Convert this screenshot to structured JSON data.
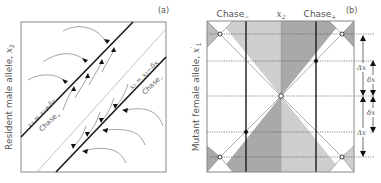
{
  "panel_a": {
    "tag": "(a)",
    "ylabel": "Resident male allele, ",
    "ylabel_var": "x",
    "ylabel_sub": "2",
    "upper_line_label": "x₂ = x₁+δx",
    "lower_line_label": "x₂ = x₁−δx",
    "upper_region": "Chase",
    "upper_region_sub": "+",
    "lower_region": "Chase",
    "lower_region_sub": "−"
  },
  "panel_b": {
    "tag": "(b)",
    "ylabel": "Mutant female allele, ",
    "ylabel_var": "x",
    "ylabel_sub": "1",
    "ylabel_prime": "′",
    "col_left": "Chase",
    "col_left_sub": "−",
    "col_center_var": "x",
    "col_center_sub": "2",
    "col_right": "Chase",
    "col_right_sub": "+",
    "delta_big": "Δx",
    "delta_small": "δx"
  },
  "colors": {
    "dark_gray": "#a6a6a6",
    "mid_gray": "#bdbdbd",
    "light_gray": "#d6d6d6",
    "line": "#1a1a1a",
    "flow": "#8a8a8a",
    "border": "#888888"
  }
}
